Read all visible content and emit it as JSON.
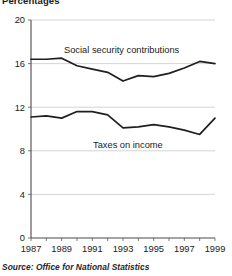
{
  "figure": {
    "unit_label": "Percentages",
    "source": "Source: Office for National Statistics"
  },
  "axis": {
    "y_ticks": [
      "0",
      "4",
      "8",
      "12",
      "16",
      "20"
    ],
    "x_ticks": [
      "1987",
      "1989",
      "1991",
      "1993",
      "1995",
      "1997",
      "1999"
    ]
  },
  "labels": {
    "social_security": "Social security contributions",
    "taxes_on_income": "Taxes on income"
  },
  "chart_data": {
    "type": "line",
    "title": "Percentages",
    "subtitle": "",
    "xlabel": "",
    "ylabel": "Percentages",
    "xlim": [
      1987,
      1999
    ],
    "ylim": [
      0,
      20
    ],
    "y_ticks": [
      0,
      4,
      8,
      12,
      16,
      20
    ],
    "x_ticks": [
      1987,
      1989,
      1991,
      1993,
      1995,
      1997,
      1999
    ],
    "x": [
      1987,
      1988,
      1989,
      1990,
      1991,
      1992,
      1993,
      1994,
      1995,
      1996,
      1997,
      1998,
      1999
    ],
    "grid": "horizontal",
    "legend": "inline-labels",
    "source": "Source: Office for National Statistics",
    "series": [
      {
        "name": "Social security contributions",
        "values": [
          16.4,
          16.4,
          16.5,
          15.8,
          15.5,
          15.2,
          14.4,
          14.9,
          14.8,
          15.1,
          15.6,
          16.2,
          16.0
        ]
      },
      {
        "name": "Taxes on income",
        "values": [
          11.1,
          11.2,
          11.0,
          11.6,
          11.6,
          11.3,
          10.1,
          10.2,
          10.4,
          10.2,
          9.9,
          9.5,
          11.0
        ]
      }
    ]
  }
}
